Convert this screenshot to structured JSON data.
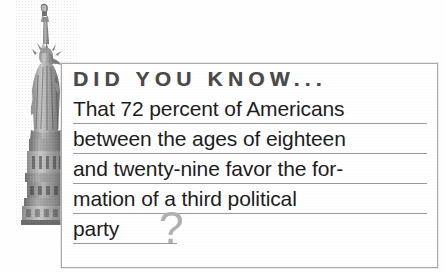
{
  "card": {
    "heading": "DID YOU KNOW...",
    "lines": [
      {
        "text": "That 72 percent of Americans",
        "rule": "full"
      },
      {
        "text": "between the ages of eighteen",
        "rule": "full"
      },
      {
        "text": "and twenty-nine favor the for-",
        "rule": "full"
      },
      {
        "text": "mation of a third political",
        "rule": "full"
      },
      {
        "text": "party",
        "rule": "short"
      }
    ],
    "question_mark": "?",
    "full_text": "That 72 percent of Americans between the ages of eighteen and twenty-nine favor the formation of a third political party?",
    "statistic": "72 percent",
    "colors": {
      "heading": "#4a4a4a",
      "body": "#1d1d1d",
      "rule": "#9b9b9b",
      "border": "#a9a9a9",
      "question_mark": "#b0b0b0",
      "background": "#ffffff"
    }
  },
  "illustration": {
    "label": "statue-of-liberty"
  }
}
